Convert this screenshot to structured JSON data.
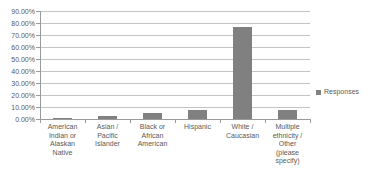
{
  "chart_data": {
    "type": "bar",
    "title": "",
    "xlabel": "",
    "ylabel": "",
    "categories": [
      "American Indian or Alaskan Native",
      "Asian / Pacific Islander",
      "Black or African American",
      "Hispanic",
      "White / Caucasian",
      "Multiple ethnicity / Other (please specify)"
    ],
    "values": [
      0.3,
      2.5,
      4.6,
      7.5,
      76.8,
      7.2
    ],
    "series": [
      {
        "name": "Responses",
        "values": [
          0.3,
          2.5,
          4.6,
          7.5,
          76.8,
          7.2
        ]
      }
    ],
    "ylim": [
      0,
      90
    ],
    "ytick_labels": [
      "90.00%",
      "80.00%",
      "70.00%",
      "60.00%",
      "50.00%",
      "40.00%",
      "30.00%",
      "20.00%",
      "10.00%",
      "0.00%"
    ],
    "ytick_values": [
      90,
      80,
      70,
      60,
      50,
      40,
      30,
      20,
      10,
      0
    ],
    "grid": true,
    "grid_axis": "y",
    "legend": {
      "position": "right",
      "entries": [
        "Responses"
      ]
    },
    "bar_color": "#808080",
    "grid_color": "#c4c4c4",
    "axis_color": "#9a9a9a",
    "text_color": "#595959"
  },
  "legend": {
    "label": "Responses"
  },
  "xcat_lines": [
    [
      "American",
      "Indian or",
      "Alaskan",
      "Native"
    ],
    [
      "Asian /",
      "Pacific",
      "Islander"
    ],
    [
      "Black or",
      "African",
      "American"
    ],
    [
      "Hispanic"
    ],
    [
      "White /",
      "Caucasian"
    ],
    [
      "Multiple",
      "ethnicity /",
      "Other",
      "(please",
      "specify)"
    ]
  ]
}
